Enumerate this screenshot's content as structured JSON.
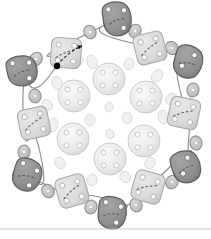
{
  "figure": {
    "background_color": "#ffffff",
    "width": 211,
    "height": 239,
    "baseline_rule": {
      "name": "bottom-rule",
      "y": 229,
      "color": "#c8c8c8"
    }
  },
  "palette": {
    "dark_blob_fill": "#8f8f8f",
    "dark_blob_stroke": "#5a5a5a",
    "light_square_fill": "#dcdcdc",
    "light_square_stroke": "#a6a6a6",
    "linker_fill": "#c4c4c4",
    "linker_stroke": "#8a8a8a",
    "button_fill": "#ededed",
    "button_stroke": "#c9c9c9",
    "hole_fill": "#fbfbfb",
    "hole_stroke": "#bdbdbd",
    "speck_fill": "#f0f0f0",
    "speck_stroke": "#d6d6d6",
    "chain_stroke": "#8a8a8a",
    "dashed_stroke": "#555555",
    "arrow_marker": "#111111",
    "start_dot": "#000000"
  },
  "outer_ring": {
    "label": "outer assembly ring",
    "node_count": 12,
    "nodes": [
      {
        "id": "dark-blob-top",
        "kind": "dark-blob",
        "cx": 117,
        "cy": 19,
        "rx": 15,
        "ry": 17,
        "rot": -8,
        "holes": 3,
        "dashed": true
      },
      {
        "id": "light-square-upper-right",
        "kind": "light-square",
        "cx": 150,
        "cy": 48,
        "size": 30,
        "rot": -14,
        "holes": 4,
        "dashed": true
      },
      {
        "id": "dark-blob-right-upper",
        "kind": "dark-blob",
        "cx": 188,
        "cy": 62,
        "rx": 15,
        "ry": 16,
        "rot": 16,
        "holes": 2,
        "dashed": true
      },
      {
        "id": "light-square-right",
        "kind": "light-square",
        "cx": 184,
        "cy": 113,
        "size": 30,
        "rot": 12,
        "holes": 4,
        "dashed": true
      },
      {
        "id": "dark-blob-right-lower",
        "kind": "dark-blob",
        "cx": 186,
        "cy": 167,
        "rx": 15,
        "ry": 16,
        "rot": -18,
        "holes": 2,
        "dashed": true
      },
      {
        "id": "light-square-lower-right",
        "kind": "light-square",
        "cx": 148,
        "cy": 187,
        "size": 30,
        "rot": 16,
        "holes": 4,
        "dashed": true
      },
      {
        "id": "dark-blob-bottom",
        "kind": "dark-blob",
        "cx": 112,
        "cy": 213,
        "rx": 15,
        "ry": 16,
        "rot": 6,
        "holes": 3,
        "dashed": true
      },
      {
        "id": "light-square-lower-left",
        "kind": "light-square",
        "cx": 72,
        "cy": 191,
        "size": 30,
        "rot": -16,
        "holes": 4,
        "dashed": true
      },
      {
        "id": "dark-blob-left-lower",
        "kind": "dark-blob",
        "cx": 27,
        "cy": 175,
        "rx": 15,
        "ry": 16,
        "rot": 18,
        "holes": 3,
        "dashed": true
      },
      {
        "id": "light-square-left",
        "kind": "light-square",
        "cx": 34,
        "cy": 123,
        "size": 30,
        "rot": -12,
        "holes": 4,
        "dashed": true
      },
      {
        "id": "dark-blob-left-upper",
        "kind": "dark-blob",
        "cx": 22,
        "cy": 71,
        "rx": 16,
        "ry": 15,
        "rot": -12,
        "holes": 3,
        "dashed": true
      },
      {
        "id": "light-square-upper-left",
        "kind": "light-square",
        "cx": 66,
        "cy": 53,
        "size": 30,
        "rot": 4,
        "holes": 4,
        "dashed": true,
        "has_arrow": true,
        "has_start_dot": true
      }
    ],
    "linkers": [
      {
        "id": "linker-1",
        "cx": 90,
        "cy": 32,
        "rx": 6,
        "ry": 7,
        "rot": -25
      },
      {
        "id": "linker-2",
        "cx": 135,
        "cy": 31,
        "rx": 6,
        "ry": 7,
        "rot": 25
      },
      {
        "id": "linker-3",
        "cx": 172,
        "cy": 48,
        "rx": 6,
        "ry": 7,
        "rot": -40
      },
      {
        "id": "linker-4",
        "cx": 193,
        "cy": 90,
        "rx": 6,
        "ry": 7,
        "rot": 10
      },
      {
        "id": "linker-5",
        "cx": 196,
        "cy": 143,
        "rx": 6,
        "ry": 7,
        "rot": -10
      },
      {
        "id": "linker-6",
        "cx": 172,
        "cy": 182,
        "rx": 6,
        "ry": 7,
        "rot": 35
      },
      {
        "id": "linker-7",
        "cx": 136,
        "cy": 205,
        "rx": 6,
        "ry": 7,
        "rot": -20
      },
      {
        "id": "linker-8",
        "cx": 91,
        "cy": 207,
        "rx": 6,
        "ry": 7,
        "rot": 20
      },
      {
        "id": "linker-9",
        "cx": 48,
        "cy": 191,
        "rx": 6,
        "ry": 7,
        "rot": -35
      },
      {
        "id": "linker-10",
        "cx": 24,
        "cy": 152,
        "rx": 6,
        "ry": 7,
        "rot": 8
      },
      {
        "id": "linker-11",
        "cx": 35,
        "cy": 96,
        "rx": 6,
        "ry": 7,
        "rot": -8
      },
      {
        "id": "linker-12",
        "cx": 36,
        "cy": 59,
        "rx": 6,
        "ry": 7,
        "rot": 35
      }
    ]
  },
  "inner_ring": {
    "label": "inner button cluster",
    "button_count": 6,
    "holes_per_button": 4,
    "buttons": [
      {
        "id": "button-top",
        "cx": 109,
        "cy": 79,
        "r": 16
      },
      {
        "id": "button-upper-right",
        "cx": 146,
        "cy": 97,
        "r": 16
      },
      {
        "id": "button-lower-right",
        "cx": 144,
        "cy": 141,
        "r": 16
      },
      {
        "id": "button-bottom",
        "cx": 110,
        "cy": 159,
        "r": 16
      },
      {
        "id": "button-lower-left",
        "cx": 73,
        "cy": 139,
        "r": 16
      },
      {
        "id": "button-upper-left",
        "cx": 74,
        "cy": 96,
        "r": 16
      }
    ]
  },
  "specks": {
    "label": "scattered small ellipses",
    "count": 18,
    "items": [
      {
        "cx": 92,
        "cy": 62,
        "rx": 5,
        "ry": 7,
        "rot": -20
      },
      {
        "cx": 129,
        "cy": 64,
        "rx": 5,
        "ry": 6,
        "rot": 25
      },
      {
        "cx": 157,
        "cy": 76,
        "rx": 5,
        "ry": 7,
        "rot": 40
      },
      {
        "cx": 163,
        "cy": 117,
        "rx": 5,
        "ry": 7,
        "rot": -10
      },
      {
        "cx": 150,
        "cy": 163,
        "rx": 5,
        "ry": 6,
        "rot": 30
      },
      {
        "cx": 125,
        "cy": 177,
        "rx": 5,
        "ry": 6,
        "rot": -30
      },
      {
        "cx": 92,
        "cy": 180,
        "rx": 5,
        "ry": 6,
        "rot": 15
      },
      {
        "cx": 60,
        "cy": 163,
        "rx": 5,
        "ry": 6,
        "rot": -35
      },
      {
        "cx": 53,
        "cy": 125,
        "rx": 5,
        "ry": 7,
        "rot": 10
      },
      {
        "cx": 57,
        "cy": 83,
        "rx": 5,
        "ry": 7,
        "rot": -25
      },
      {
        "cx": 127,
        "cy": 118,
        "rx": 5,
        "ry": 6,
        "rot": 0
      },
      {
        "cx": 90,
        "cy": 120,
        "rx": 5,
        "ry": 6,
        "rot": 0
      },
      {
        "cx": 109,
        "cy": 107,
        "rx": 4,
        "ry": 5,
        "rot": 20
      },
      {
        "cx": 110,
        "cy": 134,
        "rx": 4,
        "ry": 5,
        "rot": -20
      },
      {
        "cx": 171,
        "cy": 99,
        "rx": 5,
        "ry": 6,
        "rot": 45
      },
      {
        "cx": 47,
        "cy": 105,
        "rx": 5,
        "ry": 6,
        "rot": -45
      },
      {
        "cx": 137,
        "cy": 192,
        "rx": 4,
        "ry": 5,
        "rot": 10
      },
      {
        "cx": 79,
        "cy": 60,
        "rx": 4,
        "ry": 5,
        "rot": -10
      }
    ]
  },
  "annotations": {
    "arrow": {
      "name": "assembly-direction-arrow",
      "from": [
        57,
        65
      ],
      "to": [
        82,
        46
      ],
      "style": "dashed-with-arrowhead"
    },
    "start_dot": {
      "name": "start-point-dot",
      "cx": 57,
      "cy": 66,
      "r": 3.2
    }
  }
}
